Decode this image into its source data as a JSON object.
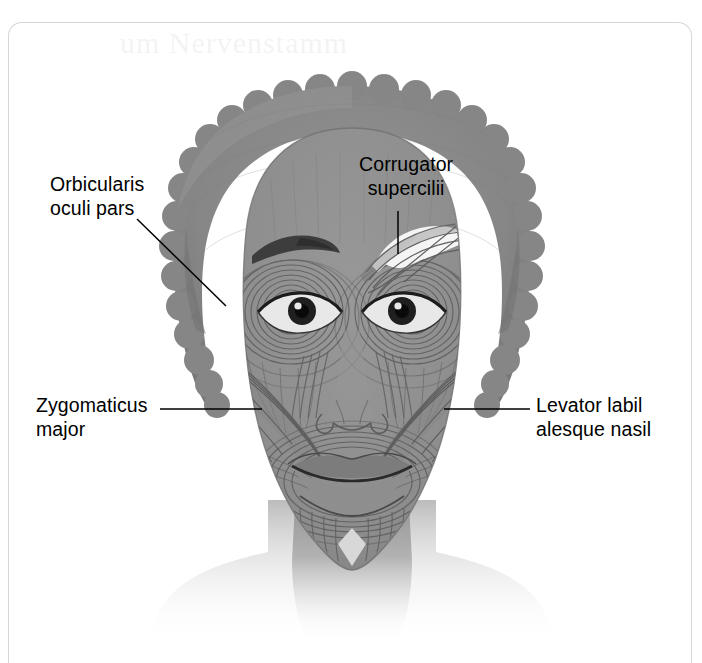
{
  "page": {
    "kind": "anatomy-figure",
    "bleed_through_text": "um Nervenstamm"
  },
  "figure": {
    "colors": {
      "skin": "#909090",
      "hair": "#8a8a8a",
      "hair_shadow": "#7d7d7d",
      "muscle_line": "#5f5f5f",
      "muscle_dark": "#6e6e6e",
      "highlight": "#f2f2f2",
      "eye_dark": "#1a1a1a",
      "label_text": "#000000",
      "leader_line": "#000000",
      "page_border": "#d6d6d6",
      "background": "#ffffff"
    }
  },
  "labels": [
    {
      "id": "orbicularis-oculi-pars",
      "line1": "Orbicularis",
      "line2": "oculi pars",
      "leader": "diagonal",
      "points_to": "concentric muscle rings around left eye"
    },
    {
      "id": "corrugator-supercilii",
      "line1": "Corrugator",
      "line2": "supercilii",
      "leader": "vertical",
      "points_to": "dissected muscle above right eye"
    },
    {
      "id": "zygomaticus-major",
      "line1": "Zygomaticus",
      "line2": "major",
      "leader": "horizontal",
      "points_to": "cheek muscle band on left side"
    },
    {
      "id": "levator-labii-alaeque-nasi",
      "line1": "Levator labil",
      "line2": "alesque nasil",
      "leader": "horizontal",
      "points_to": "muscle beside nose on right side"
    }
  ]
}
